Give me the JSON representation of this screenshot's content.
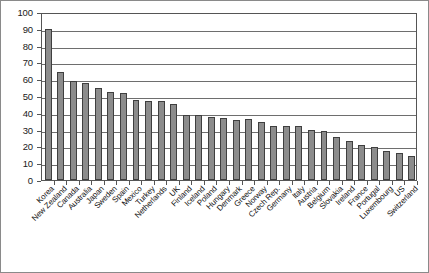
{
  "chart_data": {
    "type": "bar",
    "title": "",
    "subtitle": "",
    "xlabel": "",
    "ylabel": "",
    "ylim": [
      0,
      100
    ],
    "ytick_step": 10,
    "yticks": [
      0,
      10,
      20,
      30,
      40,
      50,
      60,
      70,
      80,
      90,
      100
    ],
    "ytick_labels": [
      "0",
      "10",
      "20",
      "30",
      "40",
      "50",
      "60",
      "70",
      "80",
      "90",
      "100"
    ],
    "grid": true,
    "grid_axis": "y",
    "legend": false,
    "legend_position": "none",
    "bar_color": "#8c8c8c",
    "bar_edge_color": "#3f3f3f",
    "axis_color": "#555555",
    "gridline_color": "#6e6e6e",
    "frame_color": "#8a8a8a",
    "xtick_label_rotation": -45,
    "sorted": "descending",
    "categories": [
      "Korea",
      "New Zealand",
      "Canada",
      "Australia",
      "Japan",
      "Sweden",
      "Spain",
      "Mexico",
      "Turkey",
      "Netherlands",
      "UK",
      "Finland",
      "Iceland",
      "Poland",
      "Hungary",
      "Denmark",
      "Greece",
      "Norway",
      "Czech Rep.",
      "Germany",
      "Italy",
      "Austria",
      "Belgium",
      "Slovakia",
      "Ireland",
      "France",
      "Portugal",
      "Luxembourg",
      "US",
      "Switzerland"
    ],
    "values": [
      90,
      64,
      59,
      57.5,
      55,
      52.5,
      51.5,
      47.5,
      47,
      47,
      45.5,
      38.5,
      38.5,
      37.5,
      37,
      36,
      36.5,
      34.5,
      32,
      32,
      32,
      30,
      29,
      25.5,
      23.5,
      21,
      19.5,
      17.5,
      16,
      14.5
    ]
  }
}
